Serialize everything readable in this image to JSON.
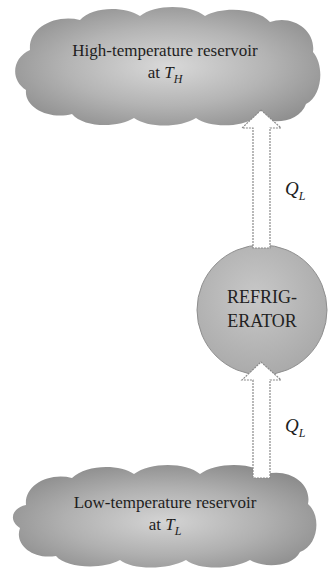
{
  "diagram": {
    "high_reservoir": {
      "line1": "High-temperature reservoir",
      "line2_prefix": "at ",
      "symbol": "T",
      "subscript": "H"
    },
    "low_reservoir": {
      "line1": "Low-temperature reservoir",
      "line2_prefix": "at ",
      "symbol": "T",
      "subscript": "L"
    },
    "device": {
      "line1": "REFRIG-",
      "line2": "ERATOR"
    },
    "arrows": [
      {
        "from": "refrigerator",
        "to": "high_reservoir",
        "label_symbol": "Q",
        "label_subscript": "L"
      },
      {
        "from": "low_reservoir",
        "to": "refrigerator",
        "label_symbol": "Q",
        "label_subscript": "L"
      }
    ],
    "colors": {
      "cloud_fill": "#9a9a9a",
      "cloud_light": "#d6d6d6",
      "circle_fill": "#b9b9b9",
      "arrow_stroke": "#8a8a8a",
      "text": "#1e1e1e"
    }
  }
}
